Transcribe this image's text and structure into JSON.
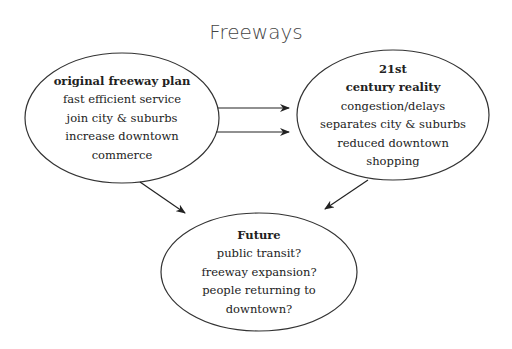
{
  "title": "Freeways",
  "nodes": {
    "original": {
      "heading": [
        "original freeway plan"
      ],
      "items": [
        "fast efficient service",
        "join city & suburbs",
        "increase downtown",
        "commerce"
      ]
    },
    "reality": {
      "heading": [
        "21st",
        "century reality"
      ],
      "items": [
        "congestion/delays",
        "separates city & suburbs",
        "reduced downtown",
        "shopping"
      ]
    },
    "future": {
      "heading": [
        "Future"
      ],
      "items": [
        "public transit?",
        "freeway expansion?",
        "people returning to",
        "downtown?"
      ]
    }
  },
  "edges": [
    {
      "from": "original",
      "to": "reality"
    },
    {
      "from": "original",
      "to": "reality"
    },
    {
      "from": "original",
      "to": "future"
    },
    {
      "from": "reality",
      "to": "future"
    }
  ],
  "colors": {
    "stroke": "#333333",
    "text": "#222222",
    "title": "#444444"
  }
}
